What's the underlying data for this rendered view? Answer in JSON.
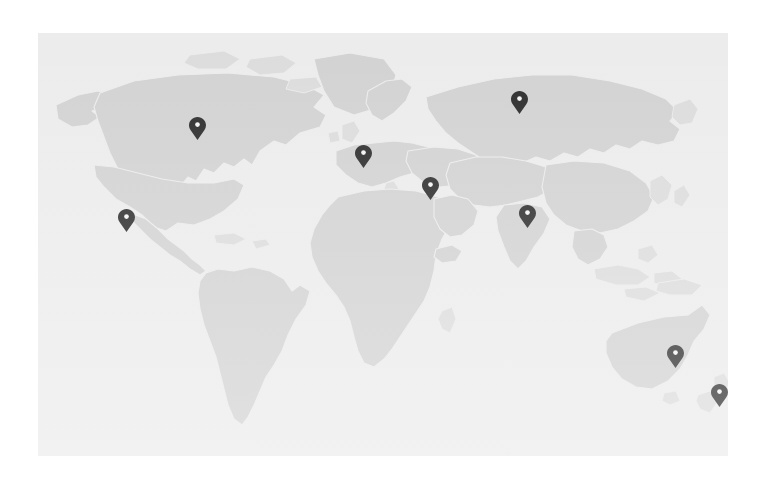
{
  "page": {
    "background_color": "#ffffff",
    "width": 762,
    "height": 486
  },
  "map": {
    "name": "world-map",
    "projection": "equirectangular",
    "ocean_color": "#ececec",
    "land_color": "#d2d2d2",
    "land_faint_color": "#dcdcdc",
    "border_color": "#ececec",
    "marker_color": "#2c2c2c",
    "frame": {
      "left": 38,
      "top": 33,
      "width": 690,
      "height": 423
    },
    "markers": [
      {
        "id": "marker-north-america",
        "label": "North America",
        "x": 197,
        "y": 140
      },
      {
        "id": "marker-mexico",
        "label": "Mexico",
        "x": 126,
        "y": 232
      },
      {
        "id": "marker-western-europe",
        "label": "Western Europe",
        "x": 363,
        "y": 168
      },
      {
        "id": "marker-russia",
        "label": "Russia",
        "x": 519,
        "y": 114
      },
      {
        "id": "marker-middle-east",
        "label": "Middle East",
        "x": 430,
        "y": 200
      },
      {
        "id": "marker-india",
        "label": "India",
        "x": 527,
        "y": 228
      },
      {
        "id": "marker-australia",
        "label": "Eastern Australia",
        "x": 675,
        "y": 368
      },
      {
        "id": "marker-new-zealand",
        "label": "New Zealand",
        "x": 719,
        "y": 407
      }
    ],
    "marker_count": 8
  }
}
